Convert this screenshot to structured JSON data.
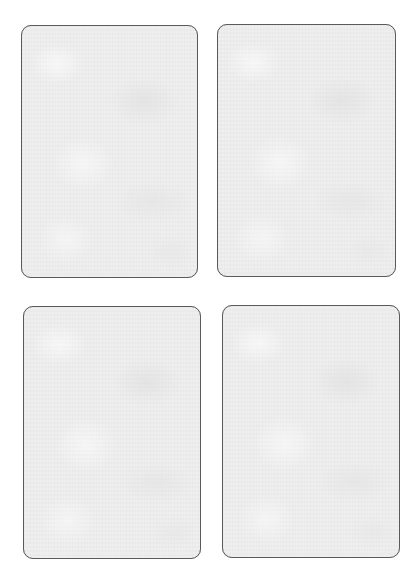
{
  "page": {
    "background": "#ffffff"
  },
  "cards": [
    {
      "id": "card-1",
      "position": "top-left",
      "content": "",
      "fill": "#eeeeee",
      "border": "#5a5a5a",
      "rect": {
        "left": 21,
        "top": 25,
        "width": 177,
        "height": 253
      }
    },
    {
      "id": "card-2",
      "position": "top-right",
      "content": "",
      "fill": "#eeeeee",
      "border": "#5a5a5a",
      "rect": {
        "left": 217,
        "top": 24,
        "width": 179,
        "height": 253
      }
    },
    {
      "id": "card-3",
      "position": "bottom-left",
      "content": "",
      "fill": "#eeeeee",
      "border": "#5a5a5a",
      "rect": {
        "left": 23,
        "top": 306,
        "width": 178,
        "height": 253
      }
    },
    {
      "id": "card-4",
      "position": "bottom-right",
      "content": "",
      "fill": "#eeeeee",
      "border": "#5a5a5a",
      "rect": {
        "left": 222,
        "top": 305,
        "width": 178,
        "height": 253
      }
    }
  ]
}
